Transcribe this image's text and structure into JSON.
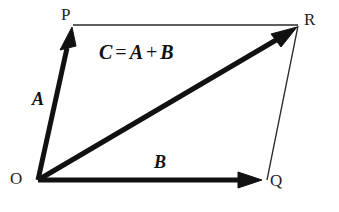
{
  "figure": {
    "background_color": "#ffffff",
    "stroke_color": "#111111",
    "thin_stroke_color": "#2a2a2a"
  },
  "equation": {
    "resultant": "C",
    "equals": "=",
    "first_term": "A",
    "plus": "+",
    "second_term": "B",
    "full_text": "C = A + B"
  },
  "vertices": [
    {
      "id": "O",
      "label": "O",
      "x": 38,
      "y": 180
    },
    {
      "id": "P",
      "label": "P",
      "x": 73,
      "y": 26
    },
    {
      "id": "R",
      "label": "R",
      "x": 297,
      "y": 27
    },
    {
      "id": "Q",
      "label": "Q",
      "x": 267,
      "y": 180
    }
  ],
  "vectors": [
    {
      "id": "A",
      "label": "A",
      "from": "O",
      "to": "P",
      "x1": 38,
      "y1": 180,
      "x2": 72,
      "y2": 28,
      "stroke_width": 5,
      "arrowhead": true,
      "style": "bold"
    },
    {
      "id": "B",
      "label": "B",
      "from": "O",
      "to": "Q",
      "x1": 38,
      "y1": 180,
      "x2": 261,
      "y2": 180,
      "stroke_width": 5,
      "arrowhead": true,
      "style": "bold"
    },
    {
      "id": "C",
      "label": "C",
      "from": "O",
      "to": "R",
      "x1": 38,
      "y1": 180,
      "x2": 295,
      "y2": 29,
      "stroke_width": 5,
      "arrowhead": true,
      "style": "bold"
    }
  ],
  "construction_lines": [
    {
      "id": "PR",
      "from": "P",
      "to": "R",
      "x1": 73,
      "y1": 25,
      "x2": 298,
      "y2": 25,
      "stroke_width": 1.2
    },
    {
      "id": "QR",
      "from": "Q",
      "to": "R",
      "x1": 267,
      "y1": 180,
      "x2": 298,
      "y2": 26,
      "stroke_width": 1.2
    }
  ]
}
